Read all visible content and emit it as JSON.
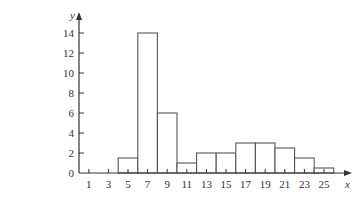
{
  "chart_data": {
    "type": "bar",
    "subtype": "histogram",
    "title": "",
    "xlabel": "x",
    "ylabel": "y",
    "x_ticks": [
      1,
      3,
      5,
      7,
      9,
      11,
      13,
      15,
      17,
      19,
      21,
      23,
      25
    ],
    "y_ticks": [
      0,
      2,
      4,
      6,
      8,
      10,
      12,
      14
    ],
    "categories": [
      "5",
      "7",
      "9",
      "11",
      "13",
      "15",
      "17",
      "19",
      "21",
      "23",
      "25"
    ],
    "bin_centers": [
      5,
      7,
      9,
      11,
      13,
      15,
      17,
      19,
      21,
      23,
      25
    ],
    "bin_width": 2,
    "values": [
      1.5,
      14,
      6,
      1,
      2,
      2,
      3,
      3,
      2.5,
      1.5,
      0.5
    ],
    "xlim": [
      0,
      27
    ],
    "ylim": [
      0,
      15
    ],
    "grid": false,
    "legend": null
  },
  "style": {
    "axis_color": "#333333",
    "bar_stroke": "#555555",
    "bar_fill": "#ffffff"
  }
}
